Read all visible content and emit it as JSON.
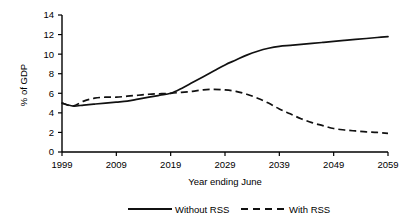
{
  "chart_data": {
    "type": "line",
    "title": "",
    "xlabel": "Year ending June",
    "ylabel": "% of GDP",
    "xlim": [
      1999,
      2059
    ],
    "ylim": [
      0,
      14
    ],
    "ytick_step": 2,
    "xtick_step": 10,
    "grid": false,
    "legend_position": "bottom",
    "xticks": [
      "1999",
      "2009",
      "2019",
      "2029",
      "2039",
      "2049",
      "2059"
    ],
    "yticks": [
      "0",
      "2",
      "4",
      "6",
      "8",
      "10",
      "12",
      "14"
    ],
    "x": [
      1999,
      2001,
      2003,
      2005,
      2007,
      2009,
      2011,
      2013,
      2015,
      2017,
      2019,
      2021,
      2023,
      2025,
      2027,
      2029,
      2031,
      2033,
      2035,
      2037,
      2039,
      2041,
      2043,
      2045,
      2047,
      2049,
      2051,
      2053,
      2055,
      2057,
      2059
    ],
    "series": [
      {
        "name": "Without RSS",
        "style": "solid",
        "color": "#111111",
        "values": [
          5.0,
          4.7,
          4.8,
          4.9,
          5.0,
          5.1,
          5.2,
          5.4,
          5.6,
          5.8,
          6.0,
          6.5,
          7.1,
          7.7,
          8.3,
          8.9,
          9.4,
          9.9,
          10.3,
          10.6,
          10.8,
          10.9,
          11.0,
          11.1,
          11.2,
          11.3,
          11.4,
          11.5,
          11.6,
          11.7,
          11.8
        ]
      },
      {
        "name": "With RSS",
        "style": "dashed",
        "color": "#111111",
        "values": [
          5.0,
          4.7,
          5.2,
          5.5,
          5.6,
          5.6,
          5.7,
          5.8,
          5.9,
          5.95,
          6.0,
          6.1,
          6.2,
          6.35,
          6.4,
          6.35,
          6.2,
          5.9,
          5.5,
          5.0,
          4.4,
          3.9,
          3.4,
          3.0,
          2.7,
          2.4,
          2.25,
          2.15,
          2.05,
          2.0,
          1.9
        ]
      }
    ]
  },
  "legend": {
    "entries": [
      {
        "label": "Without RSS",
        "style": "solid"
      },
      {
        "label": "With RSS",
        "style": "dashed"
      }
    ]
  }
}
